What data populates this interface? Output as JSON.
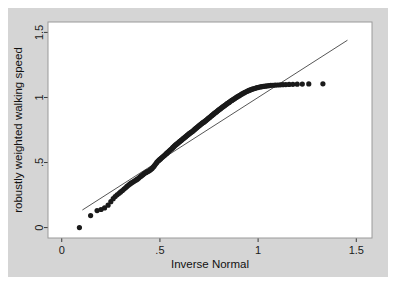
{
  "figure": {
    "background_color": "#d5d5d5",
    "page_color": "#ffffff",
    "plot_background_color": "#ffffff",
    "plot_border_color": "#9a9a9a"
  },
  "chart_data": {
    "type": "scatter",
    "title": "",
    "xlabel": "Inverse Normal",
    "ylabel": "robustly weighted walking speed",
    "xlim": [
      -0.07,
      1.58
    ],
    "ylim": [
      -0.08,
      1.58
    ],
    "xticks": [
      0,
      0.5,
      1,
      1.5
    ],
    "xticklabels": [
      "0",
      ".5",
      "1",
      "1.5"
    ],
    "yticks": [
      0,
      0.5,
      1,
      1.5
    ],
    "yticklabels": [
      "0",
      ".5",
      "1",
      "1.5"
    ],
    "grid": false,
    "legend": null,
    "marker_color": "#1a1a1a",
    "marker_size": 3.4,
    "reference_line": {
      "name": "45-degree reference line",
      "color": "#2b2b2b",
      "width": 0.8,
      "x": [
        0.105,
        1.455
      ],
      "y": [
        0.135,
        1.44
      ]
    },
    "series": [
      {
        "name": "robustly weighted walking speed quantiles",
        "x": [
          0.09,
          0.147,
          0.18,
          0.2,
          0.218,
          0.236,
          0.25,
          0.262,
          0.272,
          0.282,
          0.292,
          0.3,
          0.309,
          0.317,
          0.325,
          0.332,
          0.339,
          0.346,
          0.353,
          0.36,
          0.366,
          0.372,
          0.379,
          0.385,
          0.391,
          0.396,
          0.402,
          0.408,
          0.413,
          0.419,
          0.424,
          0.43,
          0.435,
          0.44,
          0.445,
          0.45,
          0.455,
          0.46,
          0.465,
          0.47,
          0.475,
          0.48,
          0.484,
          0.489,
          0.494,
          0.498,
          0.503,
          0.507,
          0.512,
          0.516,
          0.521,
          0.525,
          0.53,
          0.534,
          0.538,
          0.543,
          0.547,
          0.551,
          0.555,
          0.56,
          0.564,
          0.568,
          0.572,
          0.576,
          0.58,
          0.584,
          0.588,
          0.592,
          0.596,
          0.6,
          0.604,
          0.608,
          0.612,
          0.616,
          0.62,
          0.624,
          0.628,
          0.632,
          0.636,
          0.64,
          0.644,
          0.648,
          0.651,
          0.655,
          0.659,
          0.663,
          0.667,
          0.671,
          0.675,
          0.678,
          0.682,
          0.686,
          0.69,
          0.694,
          0.698,
          0.702,
          0.706,
          0.71,
          0.713,
          0.717,
          0.721,
          0.725,
          0.729,
          0.733,
          0.737,
          0.741,
          0.745,
          0.749,
          0.753,
          0.757,
          0.761,
          0.765,
          0.769,
          0.773,
          0.777,
          0.781,
          0.786,
          0.79,
          0.794,
          0.798,
          0.802,
          0.807,
          0.811,
          0.815,
          0.82,
          0.824,
          0.829,
          0.833,
          0.838,
          0.842,
          0.847,
          0.852,
          0.856,
          0.861,
          0.866,
          0.871,
          0.876,
          0.881,
          0.886,
          0.891,
          0.896,
          0.902,
          0.907,
          0.913,
          0.918,
          0.924,
          0.93,
          0.936,
          0.942,
          0.948,
          0.954,
          0.96,
          0.967,
          0.974,
          0.981,
          0.988,
          0.995,
          1.003,
          1.011,
          1.019,
          1.027,
          1.036,
          1.045,
          1.055,
          1.065,
          1.076,
          1.087,
          1.099,
          1.112,
          1.126,
          1.141,
          1.158,
          1.177,
          1.199,
          1.225,
          1.258,
          1.33
        ],
        "y": [
          0.0,
          0.092,
          0.131,
          0.139,
          0.151,
          0.172,
          0.199,
          0.222,
          0.239,
          0.252,
          0.263,
          0.274,
          0.285,
          0.296,
          0.306,
          0.316,
          0.325,
          0.334,
          0.341,
          0.348,
          0.354,
          0.36,
          0.366,
          0.372,
          0.379,
          0.386,
          0.393,
          0.4,
          0.407,
          0.413,
          0.419,
          0.424,
          0.429,
          0.433,
          0.437,
          0.442,
          0.448,
          0.455,
          0.463,
          0.472,
          0.482,
          0.492,
          0.501,
          0.509,
          0.516,
          0.522,
          0.528,
          0.534,
          0.54,
          0.546,
          0.552,
          0.558,
          0.564,
          0.57,
          0.576,
          0.582,
          0.588,
          0.594,
          0.6,
          0.606,
          0.612,
          0.618,
          0.624,
          0.63,
          0.635,
          0.64,
          0.645,
          0.65,
          0.655,
          0.66,
          0.665,
          0.67,
          0.675,
          0.68,
          0.685,
          0.69,
          0.695,
          0.7,
          0.705,
          0.71,
          0.715,
          0.72,
          0.724,
          0.728,
          0.732,
          0.736,
          0.741,
          0.746,
          0.751,
          0.756,
          0.761,
          0.766,
          0.771,
          0.776,
          0.781,
          0.786,
          0.791,
          0.796,
          0.8,
          0.804,
          0.808,
          0.812,
          0.817,
          0.822,
          0.827,
          0.832,
          0.837,
          0.842,
          0.847,
          0.852,
          0.857,
          0.862,
          0.867,
          0.872,
          0.877,
          0.882,
          0.887,
          0.892,
          0.897,
          0.902,
          0.907,
          0.912,
          0.917,
          0.922,
          0.927,
          0.932,
          0.937,
          0.942,
          0.947,
          0.952,
          0.957,
          0.962,
          0.967,
          0.972,
          0.977,
          0.982,
          0.987,
          0.992,
          0.997,
          1.002,
          1.007,
          1.012,
          1.017,
          1.022,
          1.027,
          1.032,
          1.037,
          1.042,
          1.046,
          1.05,
          1.054,
          1.058,
          1.062,
          1.066,
          1.069,
          1.072,
          1.075,
          1.078,
          1.081,
          1.083,
          1.085,
          1.087,
          1.089,
          1.091,
          1.093,
          1.094,
          1.095,
          1.096,
          1.097,
          1.098,
          1.099,
          1.1,
          1.101,
          1.102,
          1.103,
          1.104,
          1.105
        ]
      }
    ]
  }
}
